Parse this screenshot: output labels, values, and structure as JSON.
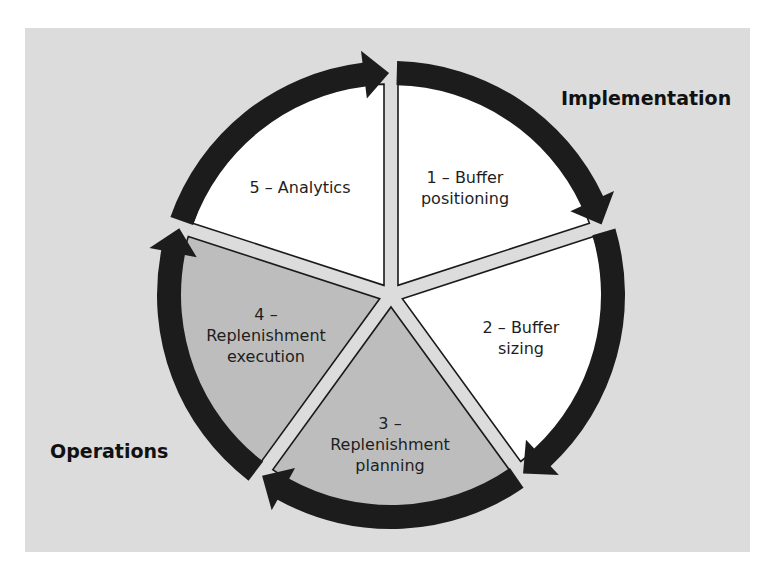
{
  "diagram": {
    "center": {
      "x": 391,
      "y": 295
    },
    "colors": {
      "background": "#dcdcdc",
      "wedge_light": "#ffffff",
      "wedge_dark": "#bdbdbd",
      "divider": "#dcdcdc",
      "outline": "#1a1a1a",
      "arrow": "#1c1c1c"
    },
    "phases": {
      "implementation": "Implementation",
      "operations": "Operations"
    },
    "steps": [
      {
        "number": "1",
        "line1": "1 – Buffer",
        "line2": "positioning",
        "phase": "implementation",
        "shade": "light"
      },
      {
        "number": "2",
        "line1": "2 – Buffer",
        "line2": "sizing",
        "phase": "implementation",
        "shade": "light"
      },
      {
        "number": "3",
        "line1": "3 –",
        "line2": "Replenishment",
        "line3": "planning",
        "phase": "operations",
        "shade": "dark"
      },
      {
        "number": "4",
        "line1": "4 –",
        "line2": "Replenishment",
        "line3": "execution",
        "phase": "operations",
        "shade": "dark"
      },
      {
        "number": "5",
        "line1": "5 – Analytics",
        "phase": "implementation",
        "shade": "light"
      }
    ]
  }
}
